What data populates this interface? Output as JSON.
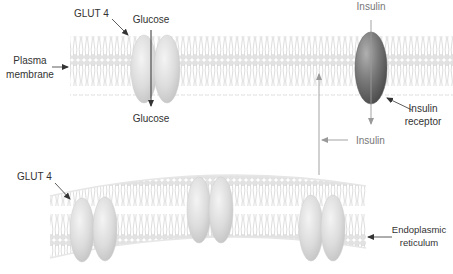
{
  "labels": {
    "glut4_top": "GLUT 4",
    "glucose_top": "Glucose",
    "glucose_bottom": "Glucose",
    "plasma_membrane_line1": "Plasma",
    "plasma_membrane_line2": "membrane",
    "insulin_top": "Insulin",
    "insulin_receptor_line1": "Insulin",
    "insulin_receptor_line2": "receptor",
    "insulin_signal": "Insulin",
    "glut4_bottom": "GLUT 4",
    "er_line1": "Endoplasmic",
    "er_line2": "reticulum"
  },
  "colors": {
    "background": "#ffffff",
    "lipid": "#d8d8d8",
    "glut4_fill": "#dcdcdc",
    "receptor_fill": "#6e6e6e",
    "arrow_dark": "#333333",
    "arrow_light": "#999999",
    "text": "#333333"
  },
  "structures": {
    "plasma_membrane": {
      "glut4_count": 1,
      "insulin_receptor_count": 1
    },
    "endoplasmic_reticulum": {
      "glut4_vesicle_pairs": 3
    }
  }
}
